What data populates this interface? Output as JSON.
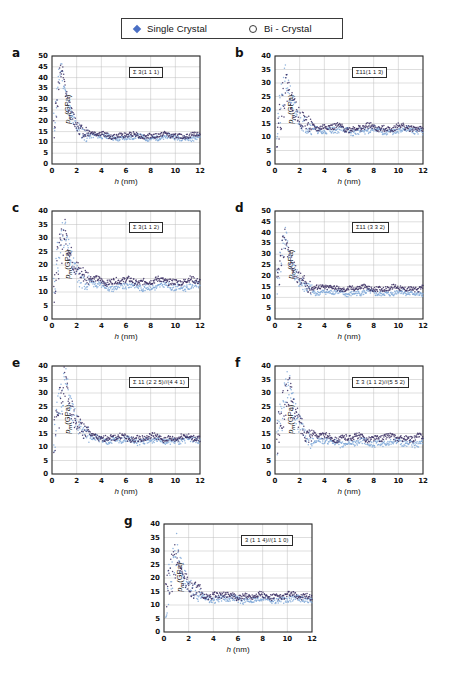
{
  "legend": {
    "entries": [
      {
        "label": "Single Crystal",
        "marker": "filled-diamond-icon",
        "color": "#4a6fc4"
      },
      {
        "label": "Bi - Crystal",
        "marker": "open-circle-icon",
        "color": "#3a3a3a"
      }
    ]
  },
  "axis_labels": {
    "y": "p_m(GPa)",
    "x": "h (nm)"
  },
  "colors": {
    "single_crystal": "#7fa8d8",
    "bi_crystal": "#3b2f63",
    "grid": "#bdbdbd",
    "frame": "#2b2b2b"
  },
  "chart_data": [
    {
      "type": "scatter",
      "panel": "a",
      "title": "Σ 3(1 1 1)",
      "xlabel": "h (nm)",
      "ylabel": "p_m(GPa)",
      "xlim": [
        0,
        12
      ],
      "ylim": [
        0,
        50
      ],
      "xticks": [
        0,
        2,
        4,
        6,
        8,
        10,
        12
      ],
      "yticks": [
        0,
        5,
        10,
        15,
        20,
        25,
        30,
        35,
        40,
        45,
        50
      ],
      "grid": true,
      "series": [
        {
          "name": "Single Crystal",
          "peak_h": 0.75,
          "peak_y": 46,
          "plateau": 12.2,
          "seed": 11
        },
        {
          "name": "Bi - Crystal",
          "peak_h": 0.8,
          "peak_y": 44,
          "plateau": 13.2,
          "seed": 12
        }
      ]
    },
    {
      "type": "scatter",
      "panel": "b",
      "title": "Σ11(1 1 3)",
      "xlabel": "h (nm)",
      "ylabel": "p_m(GPa)",
      "xlim": [
        0,
        12
      ],
      "ylim": [
        0,
        40
      ],
      "xticks": [
        0,
        2,
        4,
        6,
        8,
        10,
        12
      ],
      "yticks": [
        0,
        5,
        10,
        15,
        20,
        25,
        30,
        35,
        40
      ],
      "grid": true,
      "series": [
        {
          "name": "Single Crystal",
          "peak_h": 0.95,
          "peak_y": 32,
          "plateau": 12.3,
          "seed": 21
        },
        {
          "name": "Bi - Crystal",
          "peak_h": 1.0,
          "peak_y": 30,
          "plateau": 13.4,
          "seed": 22
        }
      ]
    },
    {
      "type": "scatter",
      "panel": "c",
      "title": "Σ 3(1 1 2)",
      "xlabel": "h (nm)",
      "ylabel": "p_m(GPa)",
      "xlim": [
        0,
        12
      ],
      "ylim": [
        0,
        40
      ],
      "xticks": [
        0,
        2,
        4,
        6,
        8,
        10,
        12
      ],
      "yticks": [
        0,
        5,
        10,
        15,
        20,
        25,
        30,
        35,
        40
      ],
      "grid": true,
      "series": [
        {
          "name": "Single Crystal",
          "peak_h": 1.0,
          "peak_y": 34.5,
          "plateau": 12.0,
          "seed": 31
        },
        {
          "name": "Bi - Crystal",
          "peak_h": 1.05,
          "peak_y": 33,
          "plateau": 14.0,
          "seed": 32
        }
      ]
    },
    {
      "type": "scatter",
      "panel": "d",
      "title": "Σ11 (3 3 2)",
      "xlabel": "h (nm)",
      "ylabel": "p_m(GPa)",
      "xlim": [
        0,
        12
      ],
      "ylim": [
        0,
        50
      ],
      "xticks": [
        0,
        2,
        4,
        6,
        8,
        10,
        12
      ],
      "yticks": [
        0,
        5,
        10,
        15,
        20,
        25,
        30,
        35,
        40,
        45,
        50
      ],
      "grid": true,
      "series": [
        {
          "name": "Single Crystal",
          "peak_h": 0.85,
          "peak_y": 40,
          "plateau": 12.0,
          "seed": 41
        },
        {
          "name": "Bi - Crystal",
          "peak_h": 0.85,
          "peak_y": 38,
          "plateau": 14.2,
          "seed": 42
        }
      ]
    },
    {
      "type": "scatter",
      "panel": "e",
      "title": "Σ 11 (2 2 5)//(4 4 1)",
      "xlabel": "h (nm)",
      "ylabel": "p_m(GPa)",
      "xlim": [
        0,
        12
      ],
      "ylim": [
        0,
        40
      ],
      "xticks": [
        0,
        2,
        4,
        6,
        8,
        10,
        12
      ],
      "yticks": [
        0,
        5,
        10,
        15,
        20,
        25,
        30,
        35,
        40
      ],
      "grid": true,
      "series": [
        {
          "name": "Single Crystal",
          "peak_h": 1.1,
          "peak_y": 36.5,
          "plateau": 12.4,
          "seed": 51
        },
        {
          "name": "Bi - Crystal",
          "peak_h": 1.1,
          "peak_y": 35,
          "plateau": 13.3,
          "seed": 52
        }
      ]
    },
    {
      "type": "scatter",
      "panel": "f",
      "title": "Σ 3 (1 1 2)//(5 5 2)",
      "xlabel": "h (nm)",
      "ylabel": "p_m(GPa)",
      "xlim": [
        0,
        12
      ],
      "ylim": [
        0,
        40
      ],
      "xticks": [
        0,
        2,
        4,
        6,
        8,
        10,
        12
      ],
      "yticks": [
        0,
        5,
        10,
        15,
        20,
        25,
        30,
        35,
        40
      ],
      "grid": true,
      "series": [
        {
          "name": "Single Crystal",
          "peak_h": 1.15,
          "peak_y": 34.5,
          "plateau": 11.5,
          "seed": 61
        },
        {
          "name": "Bi - Crystal",
          "peak_h": 1.15,
          "peak_y": 33,
          "plateau": 13.4,
          "seed": 62
        }
      ]
    },
    {
      "type": "scatter",
      "panel": "g",
      "title": "3 (1 1 4)//(1 1 0)",
      "xlabel": "h (nm)",
      "ylabel": "p_m(GPa)",
      "xlim": [
        0,
        12
      ],
      "ylim": [
        0,
        40
      ],
      "xticks": [
        0,
        2,
        4,
        6,
        8,
        10,
        12
      ],
      "yticks": [
        0,
        5,
        10,
        15,
        20,
        25,
        30,
        35,
        40
      ],
      "grid": true,
      "series": [
        {
          "name": "Single Crystal",
          "peak_h": 1.1,
          "peak_y": 30.5,
          "plateau": 12.1,
          "seed": 71
        },
        {
          "name": "Bi - Crystal",
          "peak_h": 1.05,
          "peak_y": 29,
          "plateau": 13.3,
          "seed": 72
        }
      ]
    }
  ]
}
